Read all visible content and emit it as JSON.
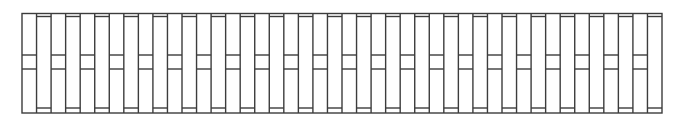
{
  "diagram": {
    "type": "column-pattern",
    "stroke_color": "#3c3c3c",
    "background": "#ffffff",
    "frame": {
      "x": 22,
      "y": 13.5,
      "width": 640,
      "height": 99.5
    },
    "column_count": 44,
    "column_types": {
      "A": {
        "bars_y": [
          55,
          69
        ],
        "description": "column with two middle horizontal bars"
      },
      "B": {
        "bars_y": [
          16.5,
          108
        ],
        "description": "column with horizontal bars near top and bottom"
      }
    },
    "pattern": [
      "A",
      "B"
    ]
  }
}
